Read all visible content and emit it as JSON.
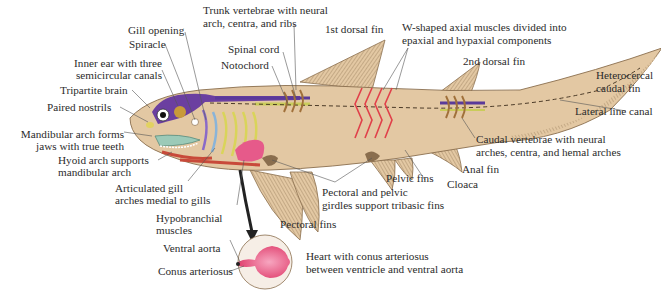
{
  "diagram": {
    "colors": {
      "body": "#e3c8a3",
      "body_outline": "#8a6e4e",
      "fin_rays": "#8a6e4e",
      "brain": "#6b3fa0",
      "nerve_cord": "#5a3a9a",
      "notochord": "#c9cc5a",
      "axial_muscles": "#e0404a",
      "gill_arches_yellow": "#d9d45a",
      "gill_arches_blue": "#8ab4d8",
      "heart": "#e65a8a",
      "aorta": "#c84a3a",
      "jaw": "#7aa89a",
      "ear": "#c89a3a",
      "leader_line": "#555555"
    }
  },
  "labels": {
    "gill_opening": "Gill opening",
    "spiracle": "Spiracle",
    "inner_ear_1": "Inner ear with three",
    "inner_ear_2": "semicircular canals",
    "tripartite_brain": "Tripartite brain",
    "paired_nostrils": "Paired nostrils",
    "mandibular_1": "Mandibular arch forms",
    "mandibular_2": "jaws with true teeth",
    "hyoid_1": "Hyoid arch supports",
    "hyoid_2": "mandibular arch",
    "gill_arches_1": "Articulated gill",
    "gill_arches_2": "arches medial to gills",
    "hypobranchial_1": "Hypobranchial",
    "hypobranchial_2": "muscles",
    "ventral_aorta": "Ventral aorta",
    "conus_arteriosus": "Conus arteriosus",
    "trunk_vertebrae_1": "Trunk vertebrae with neural",
    "trunk_vertebrae_2": "arch, centra, and ribs",
    "spinal_cord": "Spinal cord",
    "notochord": "Notochord",
    "first_dorsal": "1st dorsal fin",
    "w_muscles_1": "W-shaped axial muscles divided into",
    "w_muscles_2": "epaxial and hypaxial components",
    "second_dorsal": "2nd dorsal fin",
    "caudal_fin_1": "Heterocercal",
    "caudal_fin_2": "caudal fin",
    "lateral_line": "Lateral line canal",
    "caudal_vertebrae_1": "Caudal vertebrae with neural",
    "caudal_vertebrae_2": "arches, centra, and hemal arches",
    "anal_fin": "Anal fin",
    "pelvic_fins": "Pelvic fins",
    "cloaca": "Cloaca",
    "girdles_1": "Pectoral and pelvic",
    "girdles_2": "girdles support tribasic fins",
    "pectoral_fins": "Pectoral fins",
    "heart_1": "Heart with conus arteriosus",
    "heart_2": "between ventricle and ventral aorta"
  }
}
